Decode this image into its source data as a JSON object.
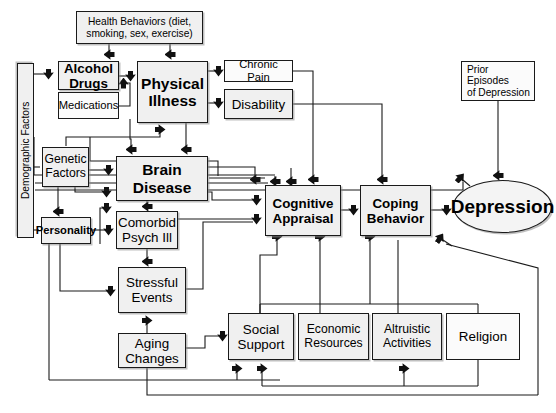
{
  "diagram": {
    "type": "flow-diagram",
    "background": "#ffffff",
    "node_fill": "#f0f0f0",
    "node_stroke": "#1a1a1a",
    "edge_color": "#1a1a1a"
  },
  "nodes": {
    "demographic_factors": {
      "label": "Demographic Factors",
      "x": 17,
      "y": 63,
      "w": 17,
      "h": 175,
      "shape": "rect",
      "orientation": "vertical"
    },
    "health_behaviors": {
      "label": "Health Behaviors (diet,\nsmoking, sex, exercise)",
      "x": 76,
      "y": 11,
      "w": 127,
      "h": 33,
      "shape": "rect"
    },
    "alcohol_drugs": {
      "label": "Alcohol\nDrugs",
      "x": 58,
      "y": 61,
      "w": 61,
      "h": 29,
      "shape": "rect"
    },
    "medications": {
      "label": "Medications",
      "x": 58,
      "y": 92,
      "w": 61,
      "h": 27,
      "shape": "rect"
    },
    "physical_illness": {
      "label": "Physical\nIllness",
      "x": 137,
      "y": 61,
      "w": 71,
      "h": 62,
      "shape": "rect"
    },
    "chronic_pain": {
      "label": "Chronic Pain",
      "x": 224,
      "y": 60,
      "w": 69,
      "h": 22,
      "shape": "rect"
    },
    "disability": {
      "label": "Disability",
      "x": 224,
      "y": 89,
      "w": 69,
      "h": 30,
      "shape": "rect"
    },
    "prior_episodes": {
      "label": "Prior Episodes\nof Depression",
      "x": 461,
      "y": 61,
      "w": 74,
      "h": 40,
      "shape": "rect"
    },
    "genetic_factors": {
      "label": "Genetic\nFactors",
      "x": 42,
      "y": 147,
      "w": 47,
      "h": 40,
      "shape": "rect"
    },
    "brain_disease": {
      "label": "Brain\nDisease",
      "x": 116,
      "y": 156,
      "w": 92,
      "h": 45,
      "shape": "rect"
    },
    "personality": {
      "label": "Personality",
      "x": 41,
      "y": 217,
      "w": 50,
      "h": 27,
      "shape": "rect"
    },
    "comorbid_psych": {
      "label": "Comorbid\nPsych Ill",
      "x": 116,
      "y": 211,
      "w": 62,
      "h": 38,
      "shape": "rect"
    },
    "stressful_events": {
      "label": "Stressful\nEvents",
      "x": 118,
      "y": 267,
      "w": 68,
      "h": 46,
      "shape": "rect"
    },
    "aging_changes": {
      "label": "Aging\nChanges",
      "x": 118,
      "y": 333,
      "w": 68,
      "h": 35,
      "shape": "rect"
    },
    "cognitive_appraisal": {
      "label": "Cognitive\nAppraisal",
      "x": 265,
      "y": 185,
      "w": 76,
      "h": 51,
      "shape": "rect"
    },
    "coping_behavior": {
      "label": "Coping\nBehavior",
      "x": 360,
      "y": 185,
      "w": 71,
      "h": 51,
      "shape": "rect"
    },
    "depression": {
      "label": "Depression",
      "x": 453,
      "y": 180,
      "w": 99,
      "h": 53,
      "shape": "ellipse"
    },
    "social_support": {
      "label": "Social\nSupport",
      "x": 228,
      "y": 313,
      "w": 66,
      "h": 47,
      "shape": "rect"
    },
    "economic_resources": {
      "label": "Economic\nResources",
      "x": 298,
      "y": 313,
      "w": 71,
      "h": 47,
      "shape": "rect"
    },
    "altruistic_activities": {
      "label": "Altruistic\nActivities",
      "x": 372,
      "y": 313,
      "w": 70,
      "h": 47,
      "shape": "rect"
    },
    "religion": {
      "label": "Religion",
      "x": 446,
      "y": 313,
      "w": 74,
      "h": 47,
      "shape": "rect"
    }
  },
  "edges": [
    {
      "from": "health_behaviors",
      "to": "alcohol_drugs"
    },
    {
      "from": "health_behaviors",
      "to": "physical_illness"
    },
    {
      "from": "demographic_factors",
      "to": "alcohol_drugs"
    },
    {
      "from": "alcohol_drugs",
      "to": "physical_illness"
    },
    {
      "from": "medications",
      "to": "physical_illness"
    },
    {
      "from": "alcohol_drugs",
      "to": "brain_disease"
    },
    {
      "from": "physical_illness",
      "to": "chronic_pain"
    },
    {
      "from": "physical_illness",
      "to": "disability"
    },
    {
      "from": "physical_illness",
      "to": "brain_disease"
    },
    {
      "from": "genetic_factors",
      "to": "brain_disease"
    },
    {
      "from": "genetic_factors",
      "to": "personality"
    },
    {
      "from": "personality",
      "to": "comorbid_psych"
    },
    {
      "from": "brain_disease",
      "to": "comorbid_psych"
    },
    {
      "from": "brain_disease",
      "to": "cognitive_appraisal"
    },
    {
      "from": "comorbid_psych",
      "to": "stressful_events"
    },
    {
      "from": "comorbid_psych",
      "to": "cognitive_appraisal"
    },
    {
      "from": "aging_changes",
      "to": "stressful_events"
    },
    {
      "from": "aging_changes",
      "to": "social_support"
    },
    {
      "from": "personality",
      "to": "stressful_events"
    },
    {
      "from": "stressful_events",
      "to": "cognitive_appraisal"
    },
    {
      "from": "chronic_pain",
      "to": "cognitive_appraisal"
    },
    {
      "from": "disability",
      "to": "coping_behavior"
    },
    {
      "from": "cognitive_appraisal",
      "to": "coping_behavior"
    },
    {
      "from": "coping_behavior",
      "to": "depression"
    },
    {
      "from": "prior_episodes",
      "to": "depression"
    },
    {
      "from": "social_support",
      "to": "cognitive_appraisal"
    },
    {
      "from": "economic_resources",
      "to": "cognitive_appraisal"
    },
    {
      "from": "altruistic_activities",
      "to": "coping_behavior"
    },
    {
      "from": "religion",
      "to": "coping_behavior"
    },
    {
      "from": "depression",
      "to": "coping_behavior"
    },
    {
      "from": "depression",
      "to": "social_support"
    },
    {
      "from": "depression",
      "to": "altruistic_activities"
    }
  ]
}
